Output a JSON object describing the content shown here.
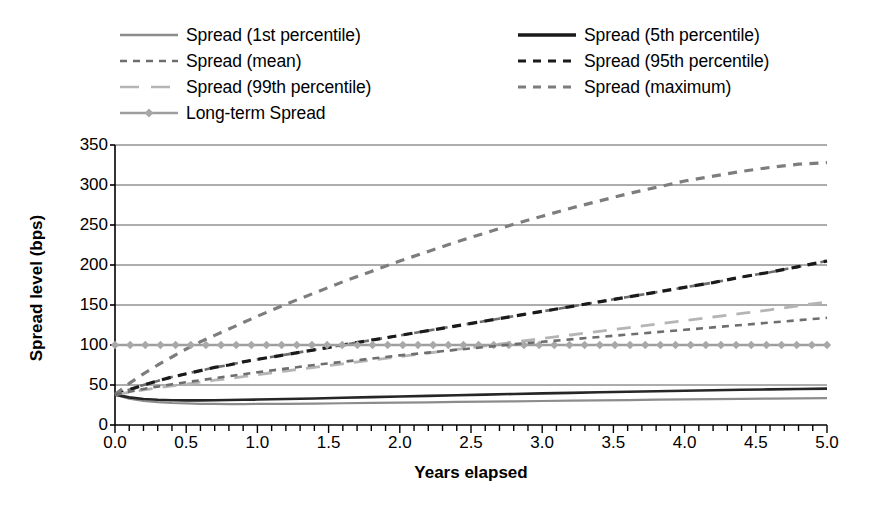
{
  "chart_data": {
    "type": "line",
    "title": "",
    "xlabel": "Years elapsed",
    "ylabel": "Spread level (bps)",
    "xlim": [
      0.0,
      5.0
    ],
    "ylim": [
      0,
      350
    ],
    "ytick_labels": [
      "350",
      "300",
      "250",
      "200",
      "150",
      "100",
      "50",
      "0"
    ],
    "ytick_values": [
      350,
      300,
      250,
      200,
      150,
      100,
      50,
      0
    ],
    "xtick_labels": [
      "0.0",
      "0.5",
      "1.0",
      "1.5",
      "2.0",
      "2.5",
      "3.0",
      "3.5",
      "4.0",
      "4.5",
      "5.0"
    ],
    "xtick_values": [
      0.0,
      0.5,
      1.0,
      1.5,
      2.0,
      2.5,
      3.0,
      3.5,
      4.0,
      4.5,
      5.0
    ],
    "grid": "horizontal",
    "minor_xticks": 50,
    "legend_position": "top",
    "x": [
      0.0,
      0.1,
      0.2,
      0.3,
      0.4,
      0.5,
      0.6,
      0.7,
      0.8,
      0.9,
      1.0,
      1.2,
      1.4,
      1.6,
      1.8,
      2.0,
      2.2,
      2.4,
      2.6,
      2.8,
      3.0,
      3.2,
      3.4,
      3.6,
      3.8,
      4.0,
      4.2,
      4.4,
      4.6,
      4.8,
      5.0
    ],
    "series": [
      {
        "name": "Spread (1st percentile)",
        "color": "#8c8c8c",
        "style": "solid",
        "width": 2.2,
        "marker": "none",
        "values": [
          38,
          33,
          30,
          28.5,
          27.5,
          27,
          26.5,
          26.3,
          26.2,
          26.2,
          26.3,
          26.5,
          26.8,
          27.2,
          27.6,
          28,
          28.4,
          28.8,
          29.2,
          29.6,
          30,
          30.4,
          30.8,
          31.2,
          31.6,
          32,
          32.4,
          32.7,
          33,
          33.3,
          33.5
        ]
      },
      {
        "name": "Spread (5th percentile)",
        "color": "#262626",
        "style": "solid",
        "width": 2.6,
        "marker": "none",
        "values": [
          38,
          34.5,
          32.5,
          31.5,
          31,
          30.8,
          30.8,
          31,
          31.2,
          31.5,
          31.8,
          32.5,
          33.2,
          34,
          34.8,
          35.6,
          36.4,
          37.2,
          38,
          38.8,
          39.5,
          40.2,
          40.9,
          41.6,
          42.2,
          42.8,
          43.4,
          44,
          44.5,
          45,
          45.5
        ]
      },
      {
        "name": "Spread (mean)",
        "color": "#6e6e6e",
        "style": "dashed",
        "width": 2.6,
        "marker": "none",
        "values": [
          38,
          44,
          50,
          55,
          60,
          64,
          68,
          72,
          75,
          79,
          82,
          88,
          94,
          100,
          106,
          112,
          118,
          124,
          130,
          136,
          142,
          148,
          154,
          160,
          166,
          172,
          178,
          185,
          191,
          198,
          205
        ]
      },
      {
        "name": "Spread (95th percentile)",
        "color": "#1a1a1a",
        "style": "dashed",
        "width": 3.2,
        "marker": "none",
        "values": [
          38,
          44,
          50,
          55,
          60,
          64,
          68,
          72,
          75,
          79,
          82,
          88,
          94,
          100,
          106,
          112,
          118,
          124,
          130,
          136,
          142,
          148,
          154,
          160,
          166,
          172,
          178,
          185,
          191,
          198,
          205
        ]
      },
      {
        "name": "Spread (99th percentile)",
        "color": "#b5b5b5",
        "style": "longdash",
        "width": 2.8,
        "marker": "none",
        "values": [
          38,
          41,
          44,
          46.5,
          49,
          51,
          53.5,
          56,
          58,
          60.5,
          63,
          67.5,
          72,
          76.5,
          81,
          85.5,
          90,
          94.5,
          99,
          103.5,
          108,
          112.5,
          117,
          121.5,
          126,
          130.5,
          135,
          139.5,
          144,
          149,
          154
        ]
      },
      {
        "name": "Spread (maximum)",
        "color": "#7d7d7d",
        "style": "dashed",
        "width": 3.2,
        "marker": "none",
        "values": [
          38,
          52,
          64,
          75,
          85,
          95,
          104,
          112,
          120,
          128,
          136,
          151,
          165,
          179,
          192,
          205,
          217,
          229,
          240,
          251,
          261,
          271,
          280,
          289,
          297,
          305,
          311,
          317,
          322,
          326,
          328
        ]
      },
      {
        "name": "Long-term Spread",
        "color": "#9e9e9e",
        "style": "solid",
        "width": 2.6,
        "marker": "diamond",
        "values": [
          100,
          100,
          100,
          100,
          100,
          100,
          100,
          100,
          100,
          100,
          100,
          100,
          100,
          100,
          100,
          100,
          100,
          100,
          100,
          100,
          100,
          100,
          100,
          100,
          100,
          100,
          100,
          100,
          100,
          100,
          100
        ]
      }
    ],
    "mean_line": {
      "name": "Spread (mean)",
      "color": "#6e6e6e",
      "values": [
        38,
        41.5,
        45,
        48,
        51,
        53.5,
        56,
        58.5,
        61,
        63.5,
        66,
        70.5,
        75,
        79,
        83,
        87,
        90.5,
        94,
        97.5,
        101,
        104,
        107,
        110,
        113,
        116,
        119,
        122,
        125,
        128,
        131,
        134
      ]
    }
  },
  "legend": {
    "left_column": [
      {
        "label": "Spread (1st percentile)",
        "icon": "line-solid-gray-icon"
      },
      {
        "label": "Spread (mean)",
        "icon": "line-dashed-gray-icon"
      },
      {
        "label": "Spread (99th percentile)",
        "icon": "line-longdash-lightgray-icon"
      },
      {
        "label": "Long-term Spread",
        "icon": "line-diamond-marker-icon"
      }
    ],
    "right_column": [
      {
        "label": "Spread (5th percentile)",
        "icon": "line-solid-black-icon"
      },
      {
        "label": "Spread (95th percentile)",
        "icon": "line-dashed-black-icon"
      },
      {
        "label": "Spread (maximum)",
        "icon": "line-dashed-mediumgray-icon"
      }
    ]
  },
  "axes": {
    "x_title": "Years elapsed",
    "y_title": "Spread level (bps)"
  }
}
